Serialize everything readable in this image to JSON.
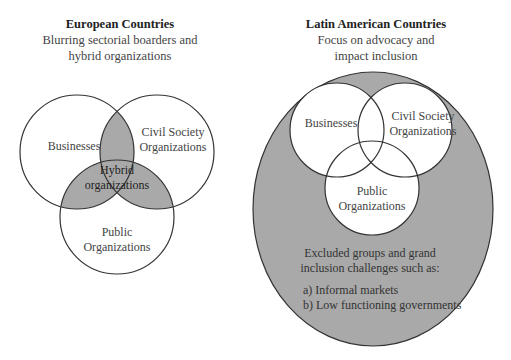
{
  "left_panel": {
    "title": "European Countries",
    "subtitle_line1": "Blurring sectorial boarders and",
    "subtitle_line2": "hybrid organizations",
    "circles": {
      "businesses": "Businesses",
      "civil_line1": "Civil Society",
      "civil_line2": "Organizations",
      "public_line1": "Public",
      "public_line2": "Organizations",
      "hybrid_line1": "Hybrid",
      "hybrid_line2": "organizations"
    }
  },
  "right_panel": {
    "title": "Latin American Countries",
    "subtitle_line1": "Focus on advocacy and",
    "subtitle_line2": "impact inclusion",
    "circles": {
      "businesses": "Businesses",
      "civil_line1": "Civil Society",
      "civil_line2": "Organizations",
      "public_line1": "Public",
      "public_line2": "Organizations"
    },
    "excluded_line1": "Excluded groups and grand",
    "excluded_line2": "inclusion challenges such as:",
    "item_a": "a) Informal markets",
    "item_b": "b) Low functioning governments"
  },
  "colors": {
    "shade": "#a9a9a9",
    "stroke": "#333333",
    "background": "#ffffff"
  }
}
